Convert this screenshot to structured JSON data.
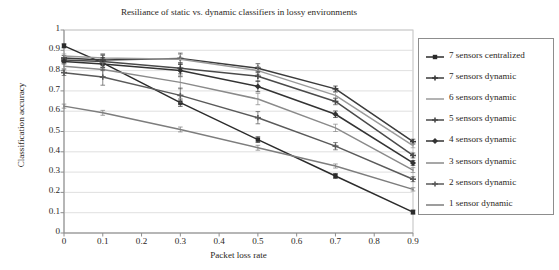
{
  "chart_data": {
    "type": "line",
    "title": "Resiliance of static vs. dynamic classifiers in lossy environments",
    "xlabel": "Packet loss rate",
    "ylabel": "Classification accuracy",
    "xlim": [
      0,
      0.9
    ],
    "ylim": [
      0,
      1
    ],
    "xticks": [
      "0",
      "0.1",
      "0.2",
      "0.3",
      "0.4",
      "0.5",
      "0.6",
      "0.7",
      "0.8",
      "0.9"
    ],
    "xtick_values": [
      0,
      0.1,
      0.2,
      0.3,
      0.4,
      0.5,
      0.6,
      0.7,
      0.8,
      0.9
    ],
    "yticks": [
      "0",
      "0.1",
      "0.2",
      "0.3",
      "0.4",
      "0.5",
      "0.6",
      "0.7",
      "0.8",
      "0.9",
      "1"
    ],
    "ytick_values": [
      0,
      0.1,
      0.2,
      0.3,
      0.4,
      0.5,
      0.6,
      0.7,
      0.8,
      0.9,
      1
    ],
    "grid": "horizontal",
    "legend_position": "right-outside",
    "error_bars": true,
    "x": [
      0,
      0.1,
      0.3,
      0.5,
      0.7,
      0.9
    ],
    "series": [
      {
        "name": "7 sensors centralized",
        "marker": "square",
        "color": "#2b2b2b",
        "values": [
          0.922,
          0.838,
          0.642,
          0.46,
          0.281,
          0.103
        ],
        "errors": [
          0.01,
          0.022,
          0.018,
          0.014,
          0.012,
          0.01
        ]
      },
      {
        "name": "7 sensors dynamic",
        "marker": "cross",
        "color": "#3b3b3b",
        "values": [
          0.862,
          0.852,
          0.86,
          0.812,
          0.71,
          0.45
        ],
        "errors": [
          0.012,
          0.028,
          0.026,
          0.022,
          0.014,
          0.012
        ]
      },
      {
        "name": "6 sensors dynamic",
        "marker": "none",
        "color": "#9a9a9a",
        "values": [
          0.872,
          0.862,
          0.856,
          0.8,
          0.678,
          0.43
        ],
        "errors": [
          0.01,
          0.022,
          0.024,
          0.02,
          0.014,
          0.01
        ]
      },
      {
        "name": "5 sensors dynamic",
        "marker": "cross",
        "color": "#4a4a4a",
        "values": [
          0.852,
          0.845,
          0.812,
          0.772,
          0.648,
          0.382
        ],
        "errors": [
          0.012,
          0.03,
          0.028,
          0.024,
          0.016,
          0.012
        ]
      },
      {
        "name": "4 sensors dynamic",
        "marker": "diamond",
        "color": "#333333",
        "values": [
          0.845,
          0.832,
          0.8,
          0.722,
          0.585,
          0.345
        ],
        "errors": [
          0.012,
          0.032,
          0.03,
          0.026,
          0.016,
          0.012
        ]
      },
      {
        "name": "3 sensors dynamic",
        "marker": "none",
        "color": "#8a8a8a",
        "values": [
          0.822,
          0.805,
          0.742,
          0.66,
          0.518,
          0.31
        ],
        "errors": [
          0.012,
          0.034,
          0.032,
          0.028,
          0.018,
          0.012
        ]
      },
      {
        "name": "2 sensors dynamic",
        "marker": "cross",
        "color": "#5a5a5a",
        "values": [
          0.79,
          0.768,
          0.678,
          0.568,
          0.428,
          0.265
        ],
        "errors": [
          0.014,
          0.04,
          0.036,
          0.03,
          0.018,
          0.012
        ]
      },
      {
        "name": "1 sensor dynamic",
        "marker": "none",
        "color": "#7d7d7d",
        "values": [
          0.625,
          0.592,
          0.51,
          0.42,
          0.33,
          0.215
        ],
        "errors": [
          0.01,
          0.012,
          0.012,
          0.012,
          0.01,
          0.008
        ]
      }
    ]
  },
  "legend": {
    "items": [
      {
        "label": "7 sensors centralized"
      },
      {
        "label": "7 sensors dynamic"
      },
      {
        "label": "6 sensors dynamic"
      },
      {
        "label": "5 sensors dynamic"
      },
      {
        "label": "4 sensors dynamic"
      },
      {
        "label": "3 sensors dynamic"
      },
      {
        "label": "2 sensors dynamic"
      },
      {
        "label": "1 sensor dynamic"
      }
    ]
  }
}
